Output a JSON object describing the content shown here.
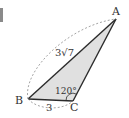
{
  "figure": {
    "type": "triangle",
    "vertices": {
      "A": {
        "label": "A",
        "x": 116,
        "y": 19
      },
      "B": {
        "label": "B",
        "x": 28,
        "y": 99
      },
      "C": {
        "label": "C",
        "x": 73,
        "y": 101
      }
    },
    "sides": {
      "AB": {
        "label": "3√7",
        "coef": "3",
        "radicand": "7"
      },
      "BC": {
        "label": "3"
      }
    },
    "angles": {
      "C": {
        "label": "120°",
        "value": "120",
        "unit": "°"
      }
    },
    "colors": {
      "fill": "#e0e0e0",
      "stroke": "#2b2b2b",
      "dashed": "#9a9a9a",
      "text": "#333333"
    }
  }
}
